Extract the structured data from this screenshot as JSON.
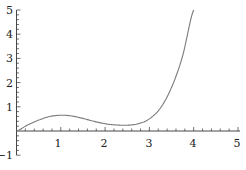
{
  "chart_data": {
    "type": "line",
    "title": "",
    "xlabel": "",
    "ylabel": "",
    "xlim": [
      0,
      5
    ],
    "ylim": [
      -1,
      5
    ],
    "x_ticks": [
      "1",
      "2",
      "3",
      "4",
      "5"
    ],
    "y_ticks": [
      "-1",
      "1",
      "2",
      "3",
      "4",
      "5"
    ],
    "grid": false,
    "legend": null,
    "series": [
      {
        "name": "f(x)",
        "color": "#7a7a7a",
        "x": [
          0,
          0.25,
          0.5,
          0.75,
          1.0,
          1.25,
          1.5,
          1.75,
          2.0,
          2.25,
          2.5,
          2.75,
          3.0,
          3.25,
          3.5,
          3.75,
          4.0
        ],
        "y": [
          0,
          0.25,
          0.45,
          0.6,
          0.65,
          0.62,
          0.52,
          0.4,
          0.3,
          0.25,
          0.24,
          0.3,
          0.5,
          0.95,
          1.8,
          3.1,
          5.0
        ]
      }
    ]
  },
  "axes": {
    "x_labels": [
      "1",
      "2",
      "3",
      "4",
      "5"
    ],
    "y_labels": [
      "5",
      "4",
      "3",
      "2",
      "1",
      "−1"
    ]
  }
}
